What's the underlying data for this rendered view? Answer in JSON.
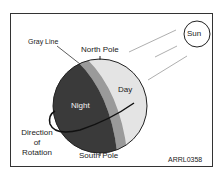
{
  "diagram": {
    "labels": {
      "gray_line": "Gray Line",
      "north_pole": "North Pole",
      "south_pole": "South Pole",
      "day": "Day",
      "night": "Night",
      "sun": "Sun",
      "direction_line1": "Direction",
      "direction_line2": "of",
      "direction_line3": "Rotation",
      "figure_id": "ARRL0358"
    },
    "colors": {
      "night": "#3a3a3a",
      "day": "#e4e4e4",
      "gray_line": "#9a9a9a",
      "outline": "#222222",
      "sun_rays": "#999999"
    }
  }
}
